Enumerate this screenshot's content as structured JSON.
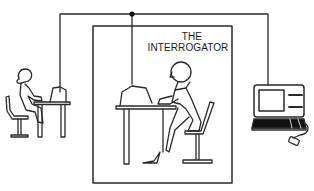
{
  "diagram": {
    "title_line1": "THE",
    "title_line2": "INTERROGATOR",
    "nodes": [
      {
        "id": "human-respondent",
        "description": "woman seated at a desk with a terminal, outside the room (left)"
      },
      {
        "id": "interrogator",
        "description": "person seated at a desk with a terminal, inside the enclosed room"
      },
      {
        "id": "computer-respondent",
        "description": "computer terminal with screen, keyboard and mouse, outside the room (right)"
      }
    ],
    "connections": [
      {
        "from": "interrogator",
        "to": "human-respondent",
        "via": "junction"
      },
      {
        "from": "interrogator",
        "to": "computer-respondent",
        "via": "junction"
      }
    ],
    "colors": {
      "line": "#2a2a2a",
      "background": "#ffffff",
      "screen_dark": "#111111"
    }
  }
}
